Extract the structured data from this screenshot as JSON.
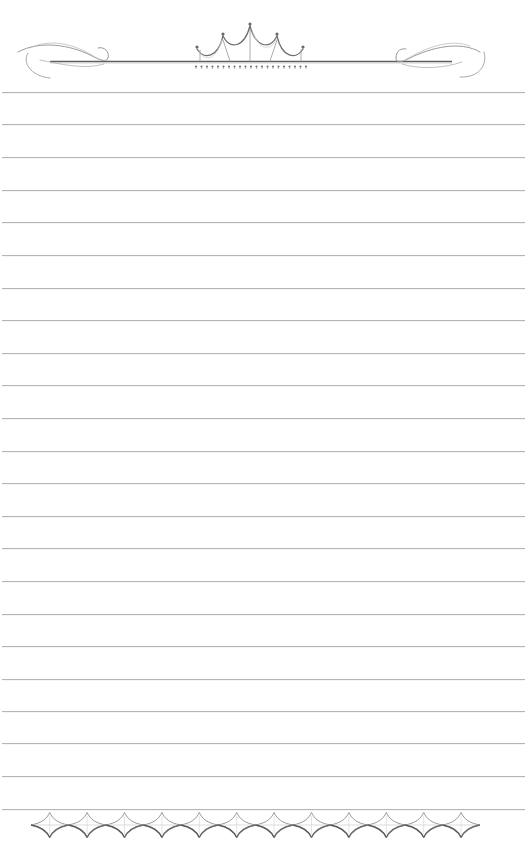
{
  "page": {
    "type": "lined-writing-paper",
    "background_color": "#ffffff",
    "line_color": "#b5b5b5",
    "ornament_color": "#6a6a6a",
    "ruled_lines": {
      "count": 23,
      "first_y": 92,
      "spacing": 32.6
    },
    "header": {
      "ornament": "crown-with-flourishes",
      "crown_finials": 5,
      "fringe_drops": 21,
      "icons": [
        "left-flourish-icon",
        "crown-icon",
        "right-flourish-icon"
      ]
    },
    "footer": {
      "ornament": "diamond-star-border",
      "diamond_count": 12
    }
  }
}
